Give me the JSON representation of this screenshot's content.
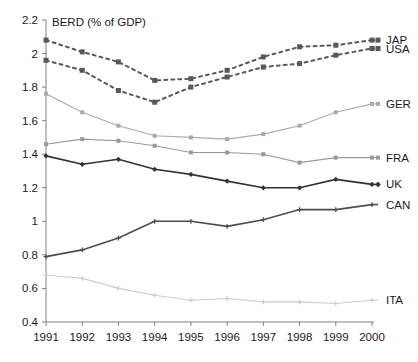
{
  "chart_data": {
    "type": "line",
    "title": "BERD (% of GDP)",
    "xlabel": "",
    "ylabel": "",
    "x": [
      1991,
      1992,
      1993,
      1994,
      1995,
      1996,
      1997,
      1998,
      1999,
      2000
    ],
    "xtick_labels": [
      "1991",
      "1992",
      "1993",
      "1994",
      "1995",
      "1996",
      "1997",
      "1998",
      "1999",
      "2000"
    ],
    "ytick_labels": [
      "0.4",
      "0.6",
      "0.8",
      "1",
      "1.2",
      "1.4",
      "1.6",
      "1.8",
      "2",
      "2.2"
    ],
    "ytick_values": [
      0.4,
      0.6,
      0.8,
      1.0,
      1.2,
      1.4,
      1.6,
      1.8,
      2.0,
      2.2
    ],
    "ylim": [
      0.4,
      2.2
    ],
    "xlim": [
      1991,
      2000
    ],
    "grid": false,
    "legend_position": "right-of-line-ends",
    "series": [
      {
        "name": "JAP",
        "label": "JAP",
        "color": "#595959",
        "style": "dashed",
        "marker": "square",
        "values": [
          2.08,
          2.01,
          1.95,
          1.84,
          1.85,
          1.9,
          1.98,
          2.04,
          2.05,
          2.08
        ]
      },
      {
        "name": "USA",
        "label": "USA",
        "color": "#595959",
        "style": "dashed",
        "marker": "square",
        "values": [
          1.96,
          1.9,
          1.78,
          1.71,
          1.8,
          1.86,
          1.92,
          1.94,
          1.99,
          2.03
        ]
      },
      {
        "name": "GER",
        "label": "GER",
        "color": "#aaaaaa",
        "style": "solid",
        "marker": "square",
        "values": [
          1.76,
          1.65,
          1.57,
          1.51,
          1.5,
          1.49,
          1.52,
          1.57,
          1.65,
          1.7
        ]
      },
      {
        "name": "FRA",
        "label": "FRA",
        "color": "#999999",
        "style": "solid",
        "marker": "square",
        "values": [
          1.46,
          1.49,
          1.48,
          1.45,
          1.41,
          1.41,
          1.4,
          1.35,
          1.38,
          1.38
        ]
      },
      {
        "name": "UK",
        "label": "UK",
        "color": "#333333",
        "style": "solid",
        "marker": "diamond",
        "values": [
          1.39,
          1.34,
          1.37,
          1.31,
          1.28,
          1.24,
          1.2,
          1.2,
          1.25,
          1.22
        ]
      },
      {
        "name": "CAN",
        "label": "CAN",
        "color": "#4d4d4d",
        "style": "solid",
        "marker": "plus",
        "values": [
          0.79,
          0.83,
          0.9,
          1.0,
          1.0,
          0.97,
          1.01,
          1.07,
          1.07,
          1.1
        ]
      },
      {
        "name": "ITA",
        "label": "ITA",
        "color": "#cccccc",
        "style": "solid",
        "marker": "plus",
        "values": [
          0.68,
          0.66,
          0.6,
          0.56,
          0.53,
          0.54,
          0.52,
          0.52,
          0.51,
          0.53
        ]
      }
    ]
  },
  "colors": {
    "axis": "#808080",
    "text": "#1a1a1a",
    "background": "#ffffff"
  }
}
